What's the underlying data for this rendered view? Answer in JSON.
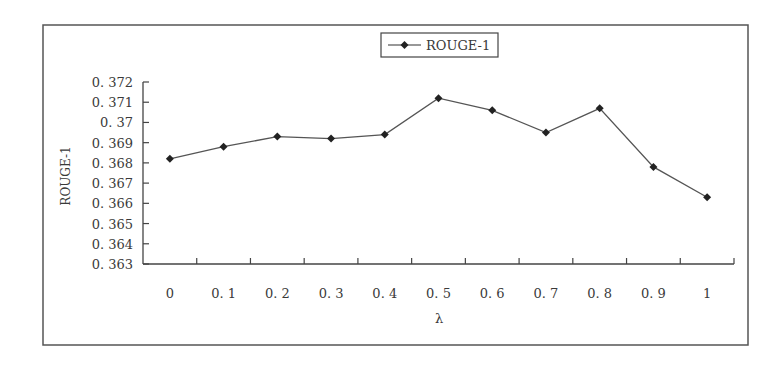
{
  "chart_data": {
    "type": "line",
    "title": "",
    "xlabel": "λ",
    "ylabel": "ROUGE-1",
    "categories": [
      "0",
      "0.1",
      "0.2",
      "0.3",
      "0.4",
      "0.5",
      "0.6",
      "0.7",
      "0.8",
      "0.9",
      "1"
    ],
    "category_labels": [
      "0",
      "0. 1",
      "0. 2",
      "0. 3",
      "0. 4",
      "0. 5",
      "0. 6",
      "0. 7",
      "0. 8",
      "0. 9",
      "1"
    ],
    "series": [
      {
        "name": "ROUGE-1",
        "marker": "diamond",
        "color": "#333333",
        "values": [
          0.3682,
          0.3688,
          0.3693,
          0.3692,
          0.3694,
          0.3712,
          0.3706,
          0.3695,
          0.3707,
          0.3678,
          0.3663
        ]
      }
    ],
    "ylim": [
      0.363,
      0.372
    ],
    "yticks": [
      0.363,
      0.364,
      0.365,
      0.366,
      0.367,
      0.368,
      0.369,
      0.37,
      0.371,
      0.372
    ],
    "ytick_labels": [
      "0. 363",
      "0. 364",
      "0. 365",
      "0. 366",
      "0. 367",
      "0. 368",
      "0. 369",
      "0. 37",
      "0. 371",
      "0. 372"
    ],
    "grid": false,
    "legend": {
      "position": "top-center",
      "entries": [
        "ROUGE-1"
      ]
    }
  },
  "legend": {
    "label": "ROUGE-1"
  },
  "axes": {
    "xlabel": "λ",
    "ylabel": "ROUGE-1"
  }
}
